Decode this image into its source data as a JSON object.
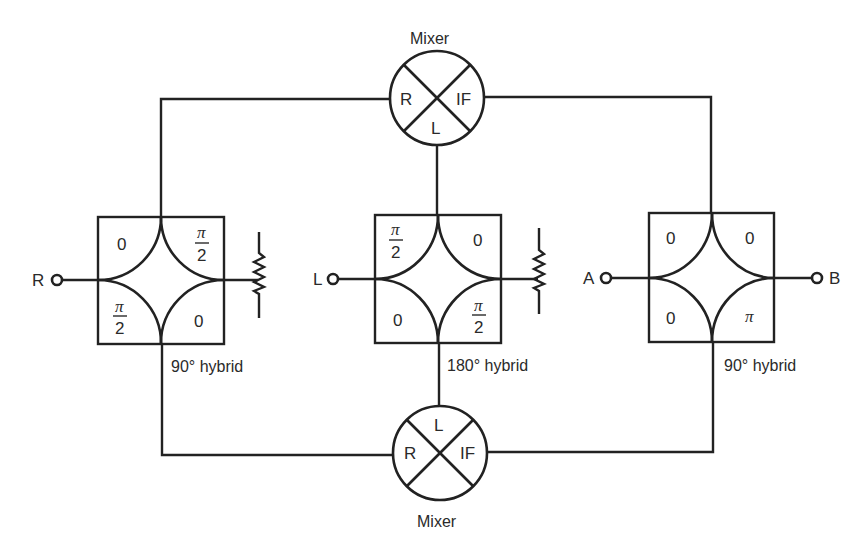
{
  "diagram": {
    "colors": {
      "line": "#222222",
      "text": "#2a2a2a",
      "background": "#ffffff"
    },
    "terminals": {
      "r": {
        "label": "R"
      },
      "l": {
        "label": "L"
      },
      "a": {
        "label": "A"
      },
      "b": {
        "label": "B"
      }
    },
    "mixer_top": {
      "caption": "Mixer",
      "ports": {
        "r": "R",
        "if": "IF",
        "l": "L"
      }
    },
    "mixer_bottom": {
      "caption": "Mixer",
      "ports": {
        "r": "R",
        "if": "IF",
        "l": "L"
      }
    },
    "hybrid_left": {
      "caption": "90° hybrid",
      "quadrants": {
        "top_left": "0",
        "top_right": "π/2",
        "bottom_left": "π/2",
        "bottom_right": "0"
      },
      "termination": "resistor"
    },
    "hybrid_center": {
      "caption": "180° hybrid",
      "quadrants": {
        "top_left": "π/2",
        "top_right": "0",
        "bottom_left": "0",
        "bottom_right": "π/2"
      },
      "termination": "resistor"
    },
    "hybrid_right": {
      "caption": "90° hybrid",
      "quadrants": {
        "top_left": "0",
        "top_right": "0",
        "bottom_left": "0",
        "bottom_right": "π"
      }
    },
    "symbols": {
      "pi": "π",
      "two": "2",
      "zero": "0"
    },
    "icons": [
      "resistor-icon",
      "mixer-icon",
      "terminal-icon",
      "hybrid-coupler-icon"
    ]
  }
}
